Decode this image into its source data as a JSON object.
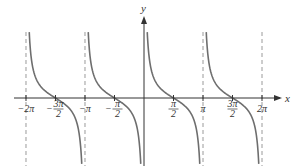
{
  "chart_data": {
    "type": "line",
    "title": "",
    "function": "y = cot(x)",
    "xlabel": "x",
    "ylabel": "y",
    "xlim": [
      -6.2832,
      6.2832
    ],
    "ylim": [
      -6,
      6.5
    ],
    "grid": false,
    "asymptotes": [
      -6.2832,
      -3.1416,
      3.1416,
      6.2832
    ],
    "asymptote_at_origin_axis": true,
    "ticks": [
      {
        "value": -6.2832,
        "label": "−2π",
        "kind": "plain"
      },
      {
        "value": -4.7124,
        "label": "3π",
        "den": "2",
        "sign": "−",
        "kind": "frac"
      },
      {
        "value": -3.1416,
        "label": "−π",
        "kind": "plain"
      },
      {
        "value": -1.5708,
        "label": "π",
        "den": "2",
        "sign": "−",
        "kind": "frac"
      },
      {
        "value": 1.5708,
        "label": "π",
        "den": "2",
        "sign": "",
        "kind": "frac"
      },
      {
        "value": 3.1416,
        "label": "π",
        "kind": "plain"
      },
      {
        "value": 4.7124,
        "label": "3π",
        "den": "2",
        "sign": "",
        "kind": "frac"
      },
      {
        "value": 6.2832,
        "label": "2π",
        "kind": "plain"
      }
    ],
    "series": [
      {
        "name": "cot(x) branch 1",
        "domain": [
          -6.2832,
          -3.1416
        ]
      },
      {
        "name": "cot(x) branch 2",
        "domain": [
          -3.1416,
          0
        ]
      },
      {
        "name": "cot(x) branch 3",
        "domain": [
          0,
          3.1416
        ]
      },
      {
        "name": "cot(x) branch 4",
        "domain": [
          3.1416,
          6.2832
        ]
      }
    ],
    "zeros": [
      -4.7124,
      -1.5708,
      1.5708,
      4.7124
    ],
    "colors": {
      "curve": "#6e6e6e",
      "axis": "#333333",
      "asymptote": "#9a9a9a"
    }
  }
}
